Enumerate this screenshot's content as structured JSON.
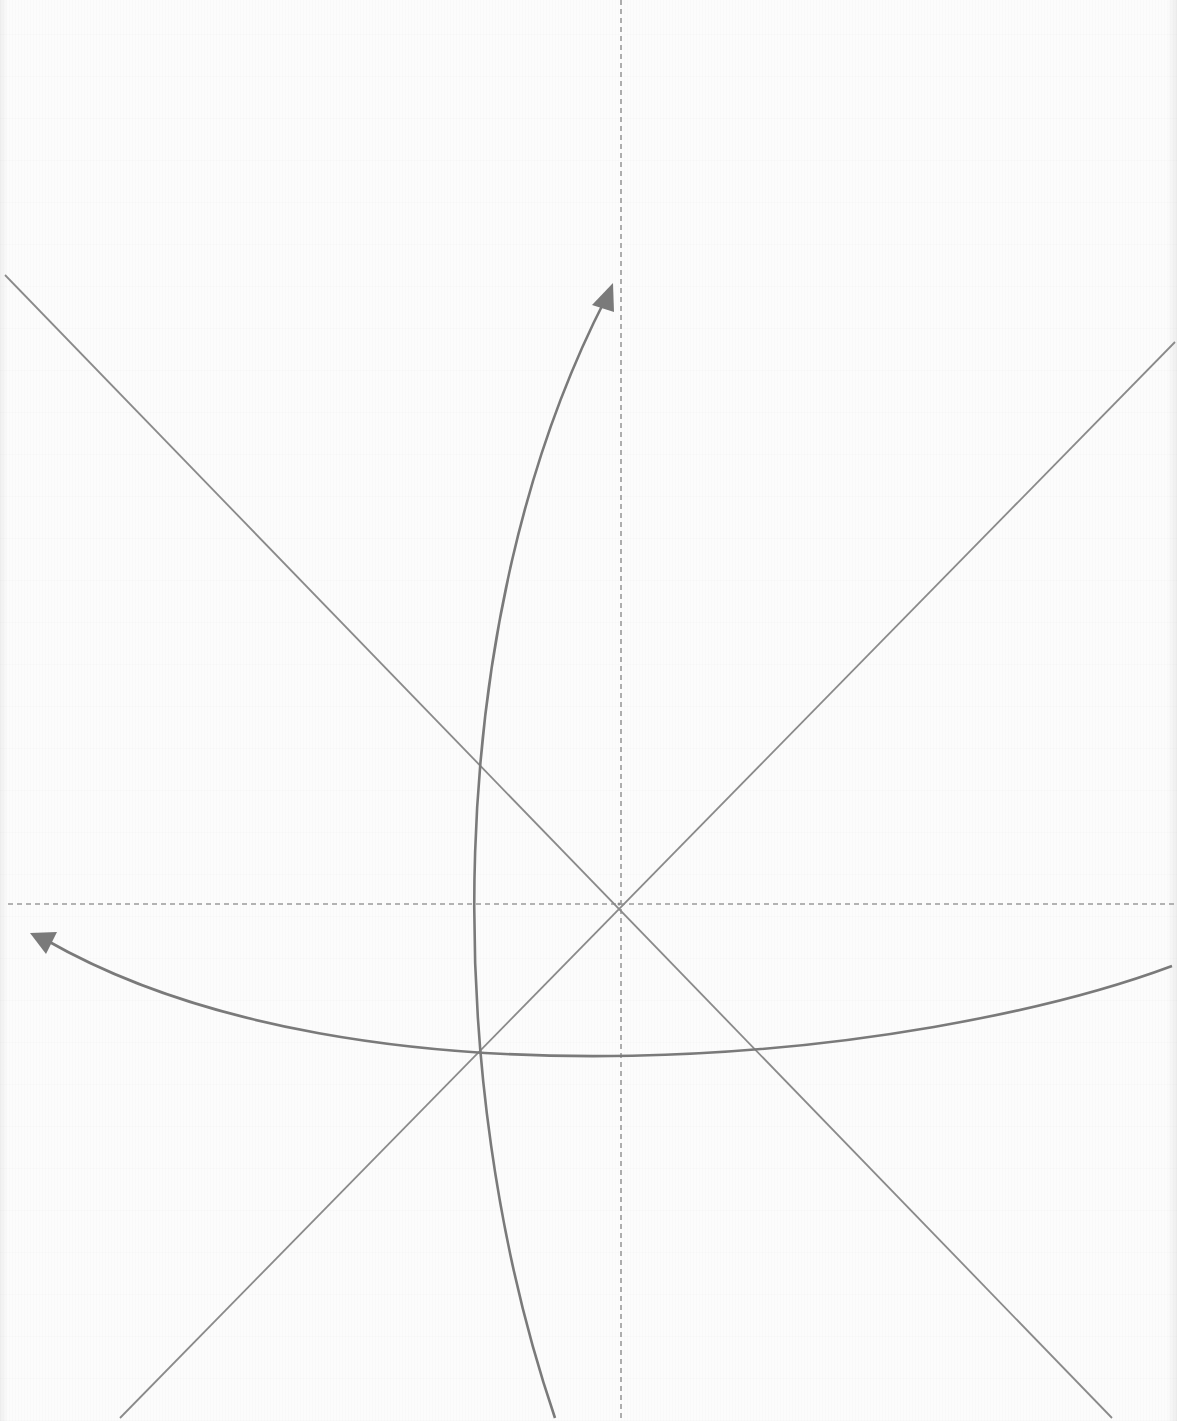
{
  "diagram": {
    "width": 1177,
    "height": 1421,
    "colors": {
      "background": "#fcfcfc",
      "line": "#8a8a8a",
      "dashed": "#9a9a9a",
      "arrow": "#7a7a7a"
    },
    "center": {
      "x": 619,
      "y": 904
    },
    "axes": {
      "vertical_dashed": {
        "x1": 621,
        "y1": 0,
        "x2": 621,
        "y2": 1421
      },
      "horizontal_dashed": {
        "x1": 8,
        "y1": 904,
        "x2": 1177,
        "y2": 904
      }
    },
    "diagonals": [
      {
        "name": "diagonal-tl-br",
        "x1": 5,
        "y1": 275,
        "x2": 1112,
        "y2": 1418
      },
      {
        "name": "diagonal-tr-bl",
        "x1": 1175,
        "y1": 342,
        "x2": 120,
        "y2": 1418
      }
    ],
    "curved_arrows": [
      {
        "name": "vertical-curved-arrow",
        "path": "M 555 1418 C 440 1080, 440 620, 606 298",
        "tip": {
          "x": 613,
          "y": 283
        },
        "direction": "up"
      },
      {
        "name": "horizontal-curved-arrow",
        "path": "M 1172 966 C 920 1060, 360 1120, 46 940",
        "tip": {
          "x": 30,
          "y": 933
        },
        "direction": "left"
      }
    ]
  }
}
